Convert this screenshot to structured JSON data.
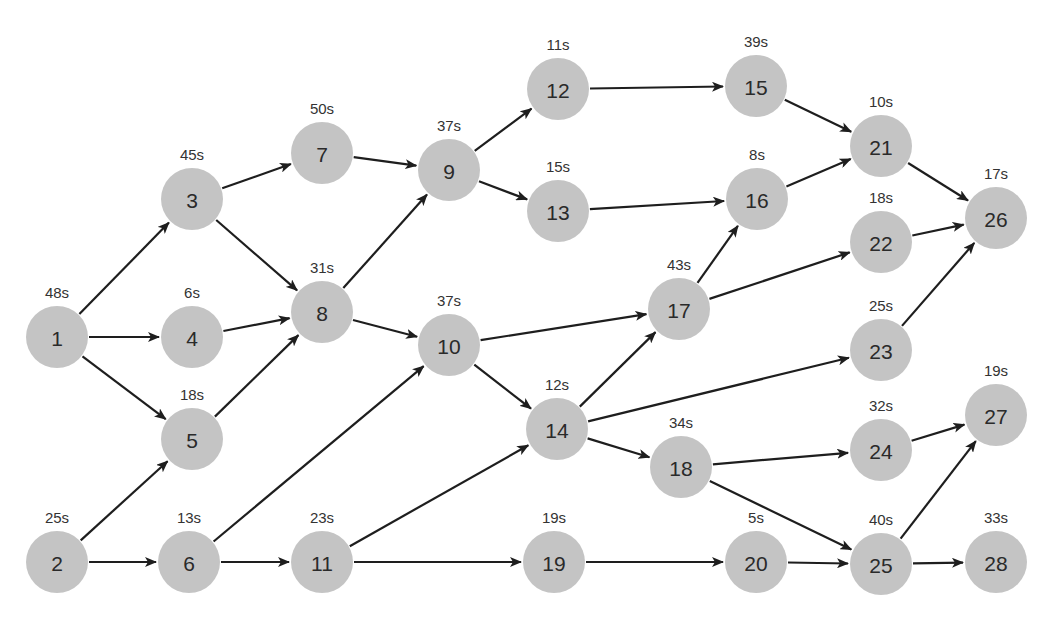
{
  "diagram": {
    "type": "directed-task-graph",
    "colors": {
      "node_fill": "#c4c4c4",
      "edge": "#1e1e1e",
      "text": "#2a2a2a",
      "background": "#ffffff"
    },
    "node_radius": 31,
    "nodes": [
      {
        "id": "1",
        "time": "48s",
        "x": 57,
        "y": 337
      },
      {
        "id": "2",
        "time": "25s",
        "x": 57,
        "y": 562
      },
      {
        "id": "3",
        "time": "45s",
        "x": 192,
        "y": 199
      },
      {
        "id": "4",
        "time": "6s",
        "x": 192,
        "y": 337
      },
      {
        "id": "5",
        "time": "18s",
        "x": 192,
        "y": 439
      },
      {
        "id": "6",
        "time": "13s",
        "x": 189,
        "y": 562
      },
      {
        "id": "7",
        "time": "50s",
        "x": 322,
        "y": 153
      },
      {
        "id": "8",
        "time": "31s",
        "x": 322,
        "y": 312
      },
      {
        "id": "9",
        "time": "37s",
        "x": 449,
        "y": 170
      },
      {
        "id": "10",
        "time": "37s",
        "x": 449,
        "y": 345
      },
      {
        "id": "11",
        "time": "23s",
        "x": 322,
        "y": 562
      },
      {
        "id": "12",
        "time": "11s",
        "x": 558,
        "y": 89
      },
      {
        "id": "13",
        "time": "15s",
        "x": 558,
        "y": 211
      },
      {
        "id": "14",
        "time": "12s",
        "x": 557,
        "y": 429
      },
      {
        "id": "15",
        "time": "39s",
        "x": 756,
        "y": 86
      },
      {
        "id": "16",
        "time": "8s",
        "x": 757,
        "y": 199
      },
      {
        "id": "17",
        "time": "43s",
        "x": 679,
        "y": 309
      },
      {
        "id": "18",
        "time": "34s",
        "x": 681,
        "y": 467
      },
      {
        "id": "19",
        "time": "19s",
        "x": 554,
        "y": 562
      },
      {
        "id": "20",
        "time": "5s",
        "x": 756,
        "y": 562
      },
      {
        "id": "21",
        "time": "10s",
        "x": 881,
        "y": 146
      },
      {
        "id": "22",
        "time": "18s",
        "x": 881,
        "y": 242
      },
      {
        "id": "23",
        "time": "25s",
        "x": 881,
        "y": 350
      },
      {
        "id": "24",
        "time": "32s",
        "x": 881,
        "y": 450
      },
      {
        "id": "25",
        "time": "40s",
        "x": 881,
        "y": 564
      },
      {
        "id": "26",
        "time": "17s",
        "x": 996,
        "y": 218
      },
      {
        "id": "27",
        "time": "19s",
        "x": 996,
        "y": 415
      },
      {
        "id": "28",
        "time": "33s",
        "x": 996,
        "y": 562
      }
    ],
    "edges": [
      [
        "1",
        "3"
      ],
      [
        "1",
        "4"
      ],
      [
        "1",
        "5"
      ],
      [
        "2",
        "5"
      ],
      [
        "2",
        "6"
      ],
      [
        "3",
        "7"
      ],
      [
        "3",
        "8"
      ],
      [
        "4",
        "8"
      ],
      [
        "5",
        "8"
      ],
      [
        "6",
        "10"
      ],
      [
        "6",
        "11"
      ],
      [
        "7",
        "9"
      ],
      [
        "8",
        "9"
      ],
      [
        "8",
        "10"
      ],
      [
        "9",
        "12"
      ],
      [
        "9",
        "13"
      ],
      [
        "10",
        "17"
      ],
      [
        "10",
        "14"
      ],
      [
        "11",
        "14"
      ],
      [
        "11",
        "19"
      ],
      [
        "12",
        "15"
      ],
      [
        "13",
        "16"
      ],
      [
        "14",
        "17"
      ],
      [
        "14",
        "23"
      ],
      [
        "14",
        "18"
      ],
      [
        "15",
        "21"
      ],
      [
        "16",
        "21"
      ],
      [
        "17",
        "16"
      ],
      [
        "17",
        "22"
      ],
      [
        "18",
        "24"
      ],
      [
        "18",
        "25"
      ],
      [
        "19",
        "20"
      ],
      [
        "20",
        "25"
      ],
      [
        "21",
        "26"
      ],
      [
        "22",
        "26"
      ],
      [
        "23",
        "26"
      ],
      [
        "24",
        "27"
      ],
      [
        "25",
        "27"
      ],
      [
        "25",
        "28"
      ]
    ]
  }
}
